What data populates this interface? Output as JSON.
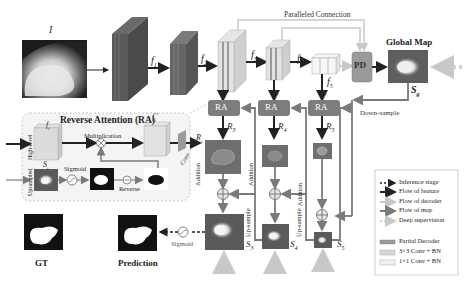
{
  "colors": {
    "feature_arrow": "#222222",
    "decoder_arrow": "#c8c8c8",
    "map_arrow": "#7a7a7a",
    "ra_box": "#7d7d7d",
    "pd_box": "#9a9a9a",
    "conv3_box": "#d8d8d8",
    "conv1_box": "#f0f0f0",
    "dark_block": "#555555",
    "ra_panel_bg": "#f4f4f4"
  },
  "input": {
    "label": "I"
  },
  "features": {
    "f1": "f1",
    "f2": "f2",
    "f3": "f3",
    "f4": "f4",
    "f5": "f5"
  },
  "feature_labels": [
    {
      "base": "f",
      "sub": "1"
    },
    {
      "base": "f",
      "sub": "2"
    },
    {
      "base": "f",
      "sub": "3"
    },
    {
      "base": "f",
      "sub": "4"
    },
    {
      "base": "f",
      "sub": "5"
    }
  ],
  "parallel_connection": "Paralleled Connection",
  "pd_label": "PD",
  "global_map": {
    "title": "Global Map",
    "symbol_base": "S",
    "symbol_sub": "g"
  },
  "down_sample": "Down-sample",
  "ra_blocks": [
    {
      "label": "RA",
      "out_base": "R",
      "out_sub": "3"
    },
    {
      "label": "RA",
      "out_base": "R",
      "out_sub": "4"
    },
    {
      "label": "RA",
      "out_base": "R",
      "out_sub": "5"
    }
  ],
  "addition_label": "Addition",
  "upsample_label": "Up-sample",
  "side_outputs": [
    {
      "base": "S",
      "sub": "3"
    },
    {
      "base": "S",
      "sub": "4"
    },
    {
      "base": "S",
      "sub": "5"
    }
  ],
  "ra_panel": {
    "title": "Reverse Attention (RA)",
    "f_in": {
      "base": "f",
      "sub": "i"
    },
    "f_out": {
      "base": "f",
      "sub": "i",
      "prime": "'"
    },
    "r_out": {
      "base": "R",
      "sub": "i"
    },
    "s_in": {
      "base": "S",
      "sub": "i"
    },
    "high_level": "High-level",
    "upsampled": "Upsampled",
    "multiplication": "Multiplication",
    "sigmoid": "Sigmoid",
    "reverse": "Reverse",
    "conv": "Conv"
  },
  "bottom": {
    "gt": "GT",
    "prediction": "Prediction",
    "sigmoid": "Sigmoid"
  },
  "legend": {
    "items": [
      {
        "label": "Inference stage",
        "style": "dotted-dark"
      },
      {
        "label": "Flow of feature",
        "style": "solid-dark"
      },
      {
        "label": "Flow of decoder",
        "style": "solid-light"
      },
      {
        "label": "Flow of map",
        "style": "solid-mid"
      },
      {
        "label": "Deep supervision",
        "style": "dotted-light"
      }
    ],
    "boxes": [
      {
        "label": "Partial Decoder",
        "color": "#9a9a9a"
      },
      {
        "label": "3×3 Conv + BN",
        "color": "#d8d8d8"
      },
      {
        "label": "1×1 Conv + BN",
        "color": "#f0f0f0"
      }
    ]
  }
}
